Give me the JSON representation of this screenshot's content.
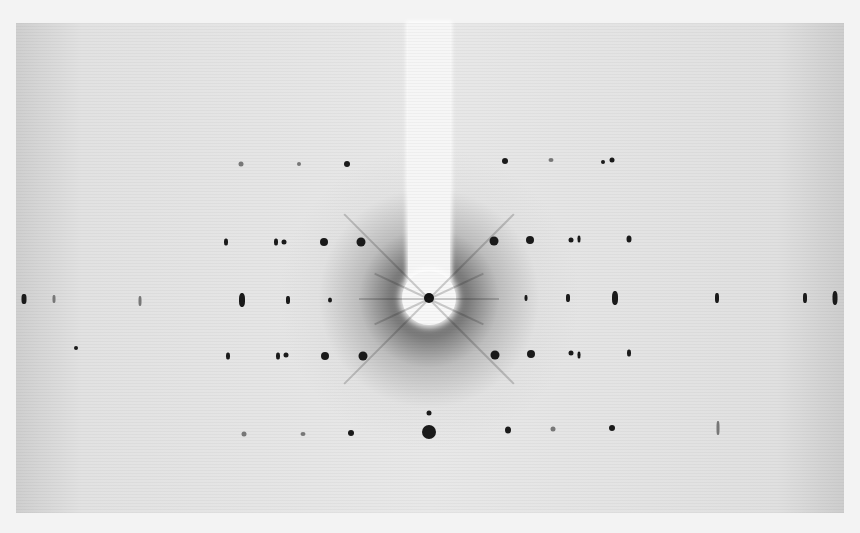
{
  "image": {
    "description": "X-ray diffraction photograph (Laue-type pattern) with beam stop from top and central spot",
    "film_area": {
      "x": 16,
      "y": 23,
      "width": 828,
      "height": 490
    },
    "beam_center": {
      "x": 429,
      "y": 298
    }
  },
  "spots": [
    {
      "x": 241,
      "y": 164,
      "w": 5,
      "h": 5,
      "faint": true
    },
    {
      "x": 299,
      "y": 164,
      "w": 4,
      "h": 4,
      "faint": true
    },
    {
      "x": 347,
      "y": 164,
      "w": 6,
      "h": 6
    },
    {
      "x": 505,
      "y": 161,
      "w": 6,
      "h": 6
    },
    {
      "x": 551,
      "y": 160,
      "w": 5,
      "h": 4,
      "faint": true
    },
    {
      "x": 603,
      "y": 162,
      "w": 4,
      "h": 4
    },
    {
      "x": 612,
      "y": 160,
      "w": 5,
      "h": 5
    },
    {
      "x": 226,
      "y": 242,
      "w": 4,
      "h": 7
    },
    {
      "x": 276,
      "y": 242,
      "w": 4,
      "h": 7
    },
    {
      "x": 284,
      "y": 242,
      "w": 5,
      "h": 5
    },
    {
      "x": 324,
      "y": 242,
      "w": 8,
      "h": 8
    },
    {
      "x": 361,
      "y": 242,
      "w": 9,
      "h": 9
    },
    {
      "x": 494,
      "y": 241,
      "w": 9,
      "h": 9
    },
    {
      "x": 530,
      "y": 240,
      "w": 8,
      "h": 8
    },
    {
      "x": 571,
      "y": 240,
      "w": 5,
      "h": 5
    },
    {
      "x": 579,
      "y": 239,
      "w": 3,
      "h": 7
    },
    {
      "x": 629,
      "y": 239,
      "w": 5,
      "h": 7
    },
    {
      "x": 24,
      "y": 299,
      "w": 5,
      "h": 10
    },
    {
      "x": 54,
      "y": 299,
      "w": 3,
      "h": 8,
      "faint": true
    },
    {
      "x": 140,
      "y": 301,
      "w": 3,
      "h": 10,
      "faint": true
    },
    {
      "x": 242,
      "y": 300,
      "w": 6,
      "h": 14
    },
    {
      "x": 288,
      "y": 300,
      "w": 4,
      "h": 8
    },
    {
      "x": 330,
      "y": 300,
      "w": 4,
      "h": 5
    },
    {
      "x": 526,
      "y": 298,
      "w": 3,
      "h": 6
    },
    {
      "x": 568,
      "y": 298,
      "w": 4,
      "h": 8
    },
    {
      "x": 615,
      "y": 298,
      "w": 6,
      "h": 14
    },
    {
      "x": 717,
      "y": 298,
      "w": 4,
      "h": 10
    },
    {
      "x": 805,
      "y": 298,
      "w": 4,
      "h": 10
    },
    {
      "x": 835,
      "y": 298,
      "w": 5,
      "h": 14
    },
    {
      "x": 228,
      "y": 356,
      "w": 4,
      "h": 7
    },
    {
      "x": 278,
      "y": 356,
      "w": 4,
      "h": 7
    },
    {
      "x": 286,
      "y": 355,
      "w": 5,
      "h": 5
    },
    {
      "x": 325,
      "y": 356,
      "w": 8,
      "h": 8
    },
    {
      "x": 363,
      "y": 356,
      "w": 9,
      "h": 9
    },
    {
      "x": 495,
      "y": 355,
      "w": 9,
      "h": 9
    },
    {
      "x": 531,
      "y": 354,
      "w": 8,
      "h": 8
    },
    {
      "x": 571,
      "y": 353,
      "w": 5,
      "h": 5
    },
    {
      "x": 579,
      "y": 355,
      "w": 3,
      "h": 7
    },
    {
      "x": 629,
      "y": 353,
      "w": 4,
      "h": 7
    },
    {
      "x": 429,
      "y": 413,
      "w": 5,
      "h": 5
    },
    {
      "x": 244,
      "y": 434,
      "w": 5,
      "h": 5,
      "faint": true
    },
    {
      "x": 303,
      "y": 434,
      "w": 5,
      "h": 4,
      "faint": true
    },
    {
      "x": 351,
      "y": 433,
      "w": 6,
      "h": 6
    },
    {
      "x": 429,
      "y": 432,
      "w": 14,
      "h": 14
    },
    {
      "x": 508,
      "y": 430,
      "w": 6,
      "h": 7
    },
    {
      "x": 553,
      "y": 429,
      "w": 5,
      "h": 5,
      "faint": true
    },
    {
      "x": 612,
      "y": 428,
      "w": 6,
      "h": 6
    },
    {
      "x": 718,
      "y": 428,
      "w": 3,
      "h": 14,
      "faint": true
    },
    {
      "x": 76,
      "y": 348,
      "w": 4,
      "h": 4
    }
  ],
  "rays": [
    {
      "x": 429,
      "y": 298,
      "len": 120,
      "angle": -135
    },
    {
      "x": 429,
      "y": 298,
      "len": 120,
      "angle": -45
    },
    {
      "x": 429,
      "y": 298,
      "len": 120,
      "angle": 135
    },
    {
      "x": 429,
      "y": 298,
      "len": 120,
      "angle": 45
    },
    {
      "x": 429,
      "y": 298,
      "len": 60,
      "angle": -155
    },
    {
      "x": 429,
      "y": 298,
      "len": 60,
      "angle": -25
    },
    {
      "x": 429,
      "y": 298,
      "len": 60,
      "angle": 155
    },
    {
      "x": 429,
      "y": 298,
      "len": 60,
      "angle": 25
    },
    {
      "x": 429,
      "y": 298,
      "len": 70,
      "angle": 180
    },
    {
      "x": 429,
      "y": 298,
      "len": 70,
      "angle": 0
    }
  ]
}
